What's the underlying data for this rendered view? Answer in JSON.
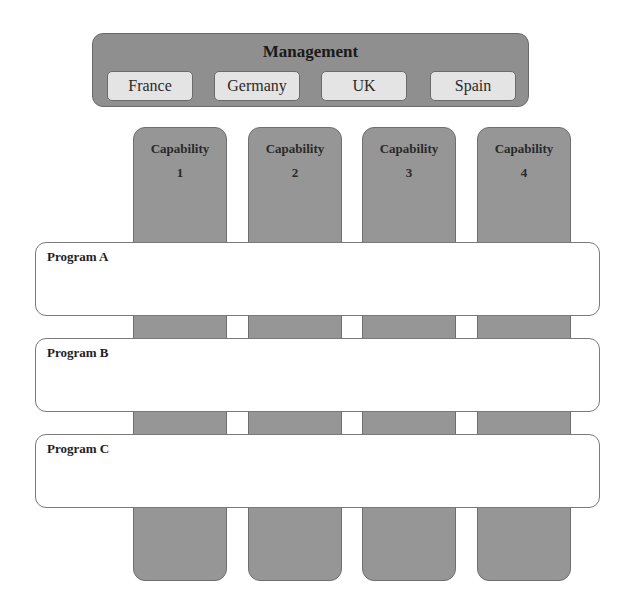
{
  "management": {
    "title": "Management",
    "countries": [
      {
        "label": "France",
        "left": 14
      },
      {
        "label": "Germany",
        "left": 121
      },
      {
        "label": "UK",
        "left": 228
      },
      {
        "label": "Spain",
        "left": 337
      }
    ]
  },
  "capabilities": [
    {
      "title": "Capability",
      "number": "1"
    },
    {
      "title": "Capability",
      "number": "2"
    },
    {
      "title": "Capability",
      "number": "3"
    },
    {
      "title": "Capability",
      "number": "4"
    }
  ],
  "programs": [
    {
      "label": "Program A"
    },
    {
      "label": "Program B"
    },
    {
      "label": "Program C"
    }
  ],
  "colors": {
    "management_fill": "#8f8f8f",
    "country_fill": "#e4e4e4",
    "capability_fill": "#969696",
    "program_fill": "#ffffff",
    "border": "#6a6a6a"
  }
}
